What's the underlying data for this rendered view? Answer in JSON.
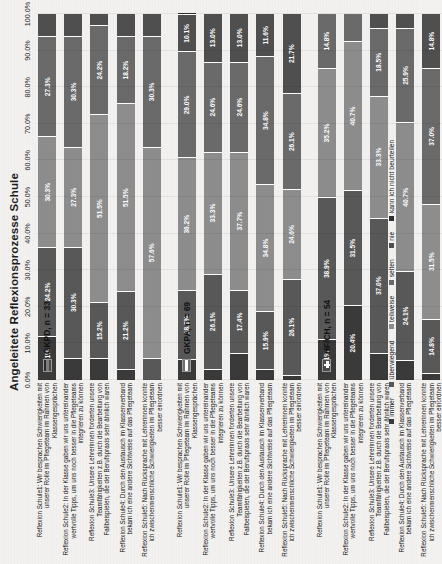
{
  "title": "Angeleitete Reflexionsprozesse Schule",
  "legend": {
    "position": "bottom",
    "items": [
      {
        "label": "immer",
        "color": "#3a3a3a"
      },
      {
        "label": "überwiegend",
        "color": "#585858"
      },
      {
        "label": "teilweise",
        "color": "#8d8d8d"
      },
      {
        "label": "selten",
        "color": "#6a6a6a"
      },
      {
        "label": "nie",
        "color": "#4f4f4f"
      },
      {
        "label": "kann ich nicht beurteilen",
        "color": "#2e2e2e"
      }
    ]
  },
  "axis": {
    "ticks": [
      "0.0%",
      "10.0%",
      "20.0%",
      "30.0%",
      "40.0%",
      "50.0%",
      "60.0%",
      "70.0%",
      "80.0%",
      "90.0%",
      "100.0%"
    ],
    "min": 0,
    "max": 100
  },
  "groups": [
    {
      "key": "gkpd",
      "label": "GKPD, n = 33",
      "flag": "de-flag-icon"
    },
    {
      "key": "gkpa",
      "label": "GKPA, n = 69",
      "flag": "at-flag-icon"
    },
    {
      "key": "hfch",
      "label": "HF/CH, n = 54",
      "flag": "ch-flag-icon"
    }
  ],
  "chart_data": {
    "type": "bar",
    "subtype": "stacked-horizontal-100",
    "title": "Angeleitete Reflexionsprozesse Schule",
    "xlabel": "",
    "ylabel": "",
    "xlim": [
      0,
      100
    ],
    "grid": true,
    "legend_position": "bottom",
    "series": [
      {
        "name": "immer",
        "color": "#3a3a3a"
      },
      {
        "name": "überwiegend",
        "color": "#585858"
      },
      {
        "name": "teilweise",
        "color": "#8d8d8d"
      },
      {
        "name": "selten",
        "color": "#6a6a6a"
      },
      {
        "name": "nie",
        "color": "#4f4f4f"
      },
      {
        "name": "kann ich nicht beurteilen",
        "color": "#2e2e2e"
      }
    ],
    "rows": [
      {
        "group": "GKPD, n = 33",
        "category": "Reflexion Schule1: Wir besprachen Schwierigkeiten mit unserer Rolle im Pflegeteam im Rahmen von Klassengesprächen",
        "values": [
          12.1,
          24.2,
          30.3,
          27.3,
          6.1,
          0.0
        ],
        "labels": [
          "12.1%",
          "24.2%",
          "30.3%",
          "27.3%",
          "",
          ""
        ]
      },
      {
        "group": "GKPD, n = 33",
        "category": "Reflexion Schule2: In der Klasse gaben wir uns untereinander wertvolle Tipps, um uns noch besser in die Pflegeteams integrieren zu können",
        "values": [
          6.1,
          30.3,
          27.3,
          30.3,
          6.0,
          0.0
        ],
        "labels": [
          "",
          "30.3%",
          "27.3%",
          "30.3%",
          "",
          ""
        ]
      },
      {
        "group": "GKPD, n = 33",
        "category": "Reflexion Schule3: Unsere Lehrerinnen forderten unsere Teamfähigkeiten z.B. durch die Bearbeitung von Fallbeispielen, die der Berufspraxis sehr ähnlich waren",
        "values": [
          6.0,
          15.2,
          51.5,
          24.2,
          3.1,
          0.0
        ],
        "labels": [
          "",
          "15.2%",
          "51.5%",
          "24.2%",
          "",
          ""
        ]
      },
      {
        "group": "GKPD, n = 33",
        "category": "Reflexion Schule4: Durch den Austausch im Klassenverband bekam ich eine andere Sichtweise auf das Pflegeteam",
        "values": [
          3.0,
          21.2,
          51.5,
          18.2,
          6.1,
          0.0
        ],
        "labels": [
          "",
          "21.2%",
          "51.5%",
          "18.2%",
          "",
          ""
        ]
      },
      {
        "group": "GKPD, n = 33",
        "category": "Reflexion Schule5: Nach Rücksprache mit Lehrerinnen konnte ich zwischenmenschliche Schwierigkeiten im Pflegeteam besser einordnen",
        "values": [
          0.0,
          6.1,
          57.6,
          30.3,
          6.0,
          0.0
        ],
        "labels": [
          "",
          "",
          "57.6%",
          "30.3%",
          "",
          ""
        ]
      },
      {
        "group": "GKPA, n = 69",
        "category": "Reflexion Schule1: Wir besprachen Schwierigkeiten mit unserer Rolle im Pflegeteam im Rahmen von Klassengesprächen",
        "values": [
          5.8,
          18.8,
          36.2,
          29.0,
          10.1,
          0.1
        ],
        "labels": [
          "",
          "18.8%",
          "36.2%",
          "29.0%",
          "10.1%",
          ""
        ]
      },
      {
        "group": "GKPA, n = 69",
        "category": "Reflexion Schule2: In der Klasse gaben wir uns untereinander wertvolle Tipps, um uns noch besser in die Pflegeteams integrieren zu können",
        "values": [
          3.0,
          26.1,
          33.3,
          24.6,
          13.0,
          0.0
        ],
        "labels": [
          "",
          "26.1%",
          "33.3%",
          "24.6%",
          "13.0%",
          ""
        ]
      },
      {
        "group": "GKPA, n = 69",
        "category": "Reflexion Schule3: Unsere Lehrerinnen forderten unsere Teamfähigkeiten z.B. durch die Bearbeitung von Fallbeispielen, die der Berufspraxis sehr ähnlich waren",
        "values": [
          7.3,
          17.4,
          37.7,
          24.6,
          13.0,
          0.0
        ],
        "labels": [
          "",
          "17.4%",
          "37.7%",
          "24.6%",
          "13.0%",
          ""
        ]
      },
      {
        "group": "GKPA, n = 69",
        "category": "Reflexion Schule4: Durch den Austausch im Klassenverband bekam ich eine andere Sichtweise auf das Pflegeteam",
        "values": [
          2.9,
          15.9,
          34.8,
          34.8,
          11.6,
          0.0
        ],
        "labels": [
          "",
          "15.9%",
          "34.8%",
          "34.8%",
          "11.6%",
          ""
        ]
      },
      {
        "group": "GKPA, n = 69",
        "category": "Reflexion Schule5: Nach Rücksprache mit Lehrerinnen konnte ich zwischenmenschliche Schwierigkeiten im Pflegeteam besser einordnen",
        "values": [
          1.5,
          26.1,
          24.6,
          26.1,
          21.7,
          0.0
        ],
        "labels": [
          "",
          "26.1%",
          "24.6%",
          "26.1%",
          "21.7%",
          ""
        ]
      },
      {
        "group": "HF/CH, n = 54",
        "category": "Reflexion Schule1: Wir besprachen Schwierigkeiten mit unserer Rolle im Pflegeteam im Rahmen von Klassengesprächen",
        "values": [
          11.1,
          38.9,
          35.2,
          14.8,
          0.0,
          0.0
        ],
        "labels": [
          "11.1%",
          "38.9%",
          "35.2%",
          "14.8%",
          "",
          ""
        ]
      },
      {
        "group": "HF/CH, n = 54",
        "category": "Reflexion Schule2: In der Klasse gaben wir uns untereinander wertvolle Tipps, um uns noch besser in die Pflegeteams integrieren zu können",
        "values": [
          20.4,
          31.5,
          40.7,
          7.4,
          0.0,
          0.0
        ],
        "labels": [
          "20.4%",
          "31.5%",
          "40.7%",
          "",
          "",
          ""
        ]
      },
      {
        "group": "HF/CH, n = 54",
        "category": "Reflexion Schule3: Unsere Lehrerinnen forderten unsere Teamfähigkeiten z.B. durch die Bearbeitung von Fallbeispielen, die der Berufspraxis sehr ähnlich waren",
        "values": [
          7.4,
          37.0,
          33.3,
          18.5,
          3.8,
          0.0
        ],
        "labels": [
          "",
          "37.0%",
          "33.3%",
          "18.5%",
          "",
          ""
        ]
      },
      {
        "group": "HF/CH, n = 54",
        "category": "Reflexion Schule4: Durch den Austausch im Klassenverband bekam ich eine andere Sichtweise auf das Pflegeteam",
        "values": [
          5.6,
          24.1,
          40.7,
          25.9,
          3.7,
          0.0
        ],
        "labels": [
          "",
          "24.1%",
          "40.7%",
          "25.9%",
          "",
          ""
        ]
      },
      {
        "group": "HF/CH, n = 54",
        "category": "Reflexion Schule5: Nach Rücksprache mit Lehrerinnen konnte ich zwischenmenschliche Schwierigkeiten im Pflegeteam besser einordnen",
        "values": [
          1.9,
          14.8,
          31.5,
          37.0,
          14.8,
          0.0
        ],
        "labels": [
          "",
          "14.8%",
          "31.5%",
          "37.0%",
          "14.8%",
          ""
        ]
      }
    ]
  }
}
